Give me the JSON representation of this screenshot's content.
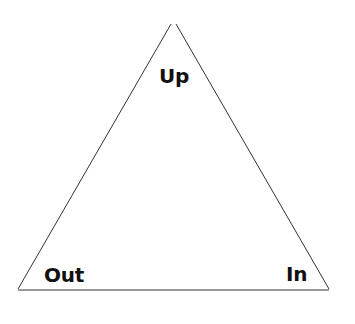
{
  "diagram": {
    "type": "triangle",
    "vertices": {
      "top": {
        "label": "Up"
      },
      "bottom_left": {
        "label": "Out"
      },
      "bottom_right": {
        "label": "In"
      }
    },
    "colors": {
      "stroke": "#333333",
      "text": "#111111",
      "background": "#ffffff"
    }
  }
}
